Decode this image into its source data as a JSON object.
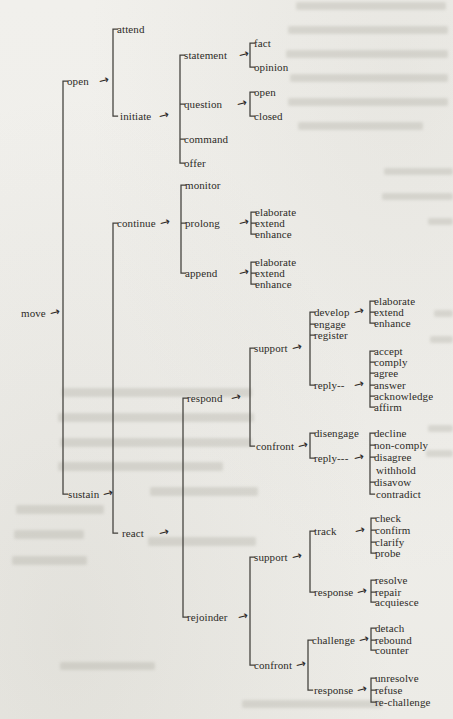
{
  "colors": {
    "ink": "#2d2b27",
    "line": "#413f3a",
    "paper": "#f0efeb",
    "bleedthrough": "#a09e93"
  },
  "icons": {
    "arrow": "→"
  },
  "diagram": {
    "tree": {
      "label": "move",
      "children": [
        {
          "label": "open",
          "children": [
            {
              "label": "attend"
            },
            {
              "label": "initiate",
              "children": [
                {
                  "label": "statement",
                  "children": [
                    {
                      "label": "fact"
                    },
                    {
                      "label": "opinion"
                    }
                  ]
                },
                {
                  "label": "question",
                  "children": [
                    {
                      "label": "open"
                    },
                    {
                      "label": "closed"
                    }
                  ]
                },
                {
                  "label": "command"
                },
                {
                  "label": "offer"
                }
              ]
            }
          ]
        },
        {
          "label": "sustain",
          "children": [
            {
              "label": "continue",
              "children": [
                {
                  "label": "monitor"
                },
                {
                  "label": "prolong",
                  "children": [
                    {
                      "label": "elaborate"
                    },
                    {
                      "label": "extend"
                    },
                    {
                      "label": "enhance"
                    }
                  ]
                },
                {
                  "label": "append",
                  "children": [
                    {
                      "label": "elaborate"
                    },
                    {
                      "label": "extend"
                    },
                    {
                      "label": "enhance"
                    }
                  ]
                }
              ]
            },
            {
              "label": "react",
              "children": [
                {
                  "label": "respond",
                  "children": [
                    {
                      "label": "support",
                      "children": [
                        {
                          "label": "develop",
                          "children": [
                            {
                              "label": "elaborate"
                            },
                            {
                              "label": "extend"
                            },
                            {
                              "label": "enhance"
                            }
                          ]
                        },
                        {
                          "label": "engage"
                        },
                        {
                          "label": "register"
                        },
                        {
                          "label": "reply--",
                          "children": [
                            {
                              "label": "accept"
                            },
                            {
                              "label": "comply"
                            },
                            {
                              "label": "agree"
                            },
                            {
                              "label": "answer"
                            },
                            {
                              "label": "acknowledge"
                            },
                            {
                              "label": "affirm"
                            }
                          ]
                        }
                      ]
                    },
                    {
                      "label": "confront",
                      "children": [
                        {
                          "label": "disengage"
                        },
                        {
                          "label": "reply---",
                          "children": [
                            {
                              "label": "decline"
                            },
                            {
                              "label": "non-comply"
                            },
                            {
                              "label": "disagree"
                            },
                            {
                              "label": "withhold"
                            },
                            {
                              "label": "disavow"
                            },
                            {
                              "label": "contradict"
                            }
                          ]
                        }
                      ]
                    }
                  ]
                },
                {
                  "label": "rejoinder",
                  "children": [
                    {
                      "label": "support",
                      "children": [
                        {
                          "label": "track",
                          "children": [
                            {
                              "label": "check"
                            },
                            {
                              "label": "confirm"
                            },
                            {
                              "label": "clarify"
                            },
                            {
                              "label": "probe"
                            }
                          ]
                        },
                        {
                          "label": "response",
                          "children": [
                            {
                              "label": "resolve"
                            },
                            {
                              "label": "repair"
                            },
                            {
                              "label": "acquiesce"
                            }
                          ]
                        }
                      ]
                    },
                    {
                      "label": "confront",
                      "children": [
                        {
                          "label": "challenge",
                          "children": [
                            {
                              "label": "detach"
                            },
                            {
                              "label": "rebound"
                            },
                            {
                              "label": "counter"
                            }
                          ]
                        },
                        {
                          "label": "response",
                          "children": [
                            {
                              "label": "unresolve"
                            },
                            {
                              "label": "refuse"
                            },
                            {
                              "label": "re-challenge"
                            }
                          ]
                        }
                      ]
                    }
                  ]
                }
              ]
            }
          ]
        }
      ]
    }
  }
}
